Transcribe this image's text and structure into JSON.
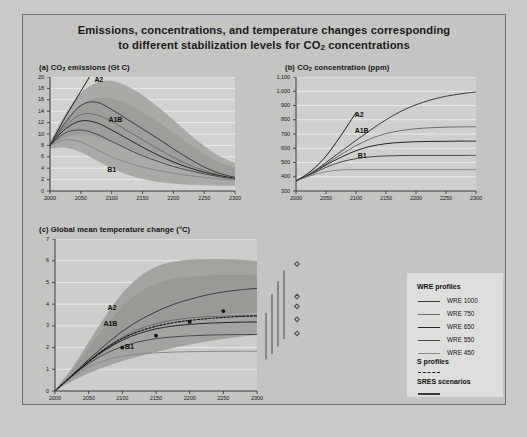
{
  "figure": {
    "title_line1": "Emissions, concentrations, and temperature changes corresponding",
    "title_line2_pre": "to different stabilization levels for CO",
    "title_line2_sub": "2",
    "title_line2_post": " concentrations",
    "caption": ""
  },
  "panels": {
    "a": {
      "label": "(a) CO",
      "label_sub": "2",
      "label_post": " emissions (Gt C)"
    },
    "b": {
      "label": "(b) CO",
      "label_sub": "2",
      "label_post": " concentration (ppm)"
    },
    "c": {
      "label": "(c) Global mean temperature change (°C)"
    }
  },
  "legend": {
    "heading_wre": "WRE profiles",
    "heading_s": "S profiles",
    "heading_sres": "SRES scenarios",
    "wre_items": [
      {
        "label": "WRE 1000",
        "color": "#3b3b3b"
      },
      {
        "label": "WRE 750",
        "color": "#6e6e6e"
      },
      {
        "label": "WRE 650",
        "color": "#262626"
      },
      {
        "label": "WRE 550",
        "color": "#4a4a4a"
      },
      {
        "label": "WRE 450",
        "color": "#8a8a8a"
      }
    ]
  },
  "annotations": {
    "a2": "A2",
    "a1b": "A1B",
    "b1": "B1"
  },
  "chart_data": [
    {
      "id": "panel-a",
      "type": "line",
      "title": "(a) CO2 emissions (Gt C)",
      "xlabel": "",
      "ylabel": "Gt C",
      "xlim": [
        2000,
        2300
      ],
      "ylim": [
        0,
        20
      ],
      "xticks": [
        2000,
        2050,
        2100,
        2150,
        2200,
        2250,
        2300
      ],
      "yticks": [
        0,
        2,
        4,
        6,
        8,
        10,
        12,
        14,
        16,
        18,
        20
      ],
      "grid": true,
      "x": [
        2000,
        2025,
        2050,
        2075,
        2100,
        2125,
        2150,
        2175,
        2200,
        2225,
        2250,
        2275,
        2300
      ],
      "series": [
        {
          "name": "WRE 1000",
          "color": "#3b3b3b",
          "values": [
            8.0,
            12.0,
            15.0,
            15.6,
            14.3,
            12.6,
            10.9,
            9.2,
            7.4,
            5.7,
            4.2,
            3.1,
            2.4
          ]
        },
        {
          "name": "WRE 750",
          "color": "#6e6e6e",
          "values": [
            8.0,
            11.4,
            13.4,
            13.4,
            12.2,
            10.6,
            9.0,
            7.4,
            5.9,
            4.6,
            3.6,
            2.8,
            2.2
          ]
        },
        {
          "name": "WRE 650",
          "color": "#262626",
          "values": [
            8.0,
            10.9,
            12.3,
            12.0,
            10.7,
            9.2,
            7.7,
            6.3,
            5.1,
            4.1,
            3.3,
            2.7,
            2.2
          ]
        },
        {
          "name": "WRE 550",
          "color": "#4a4a4a",
          "values": [
            8.0,
            10.2,
            10.7,
            10.0,
            8.7,
            7.4,
            6.2,
            5.2,
            4.3,
            3.6,
            3.0,
            2.5,
            2.1
          ]
        },
        {
          "name": "WRE 450",
          "color": "#8a8a8a",
          "values": [
            8.0,
            9.0,
            8.6,
            7.3,
            6.0,
            5.0,
            4.2,
            3.6,
            3.1,
            2.7,
            2.4,
            2.1,
            1.9
          ]
        },
        {
          "name": "A2 (SRES)",
          "color": "#1c1c1c",
          "values": [
            8.0,
            13.0,
            17.5,
            22.0,
            26.5,
            null,
            null,
            null,
            null,
            null,
            null,
            null,
            null
          ]
        }
      ],
      "envelope": {
        "name": "SRES range",
        "upper": [
          8.6,
          13.5,
          17.2,
          19.0,
          19.3,
          18.4,
          16.8,
          14.8,
          12.5,
          10.1,
          7.9,
          6.1,
          4.9
        ],
        "lower": [
          7.4,
          7.6,
          6.8,
          5.4,
          4.0,
          2.9,
          2.1,
          1.6,
          1.3,
          1.1,
          1.0,
          0.9,
          0.9
        ]
      },
      "annotations": [
        {
          "text": "A2",
          "x": 2072,
          "y": 19.4
        },
        {
          "text": "A1B",
          "x": 2095,
          "y": 12.4
        },
        {
          "text": "B1",
          "x": 2093,
          "y": 3.6
        }
      ]
    },
    {
      "id": "panel-b",
      "type": "line",
      "title": "(b) CO2 concentration (ppm)",
      "xlabel": "",
      "ylabel": "ppm",
      "xlim": [
        2000,
        2300
      ],
      "ylim": [
        300,
        1100
      ],
      "xticks": [
        2000,
        2050,
        2100,
        2150,
        2200,
        2250,
        2300
      ],
      "yticks": [
        300,
        400,
        500,
        600,
        700,
        800,
        900,
        1000,
        1100
      ],
      "ytick_labels": [
        "300",
        "400",
        "500",
        "600",
        "700",
        "800",
        "900",
        "1,000",
        "1,100"
      ],
      "grid": true,
      "x": [
        2000,
        2025,
        2050,
        2075,
        2100,
        2125,
        2150,
        2175,
        2200,
        2225,
        2250,
        2275,
        2300
      ],
      "series": [
        {
          "name": "WRE 1000",
          "color": "#3b3b3b",
          "values": [
            370,
            425,
            500,
            578,
            655,
            730,
            800,
            860,
            905,
            940,
            965,
            982,
            995
          ]
        },
        {
          "name": "WRE 750",
          "color": "#6e6e6e",
          "values": [
            370,
            422,
            490,
            556,
            618,
            668,
            703,
            724,
            737,
            744,
            748,
            750,
            751
          ]
        },
        {
          "name": "WRE 650",
          "color": "#262626",
          "values": [
            370,
            420,
            482,
            537,
            583,
            614,
            632,
            641,
            646,
            648,
            649,
            650,
            650
          ]
        },
        {
          "name": "WRE 550",
          "color": "#4a4a4a",
          "values": [
            370,
            416,
            466,
            504,
            527,
            540,
            546,
            549,
            550,
            550,
            550,
            550,
            550
          ]
        },
        {
          "name": "WRE 450",
          "color": "#8a8a8a",
          "values": [
            370,
            408,
            435,
            448,
            450,
            450,
            450,
            450,
            450,
            450,
            450,
            450,
            450
          ]
        },
        {
          "name": "A2 (SRES)",
          "color": "#1c1c1c",
          "values": [
            370,
            440,
            545,
            690,
            850,
            null,
            null,
            null,
            null,
            null,
            null,
            null,
            null
          ]
        }
      ],
      "annotations": [
        {
          "text": "A2",
          "x": 2098,
          "y": 836
        },
        {
          "text": "A1B",
          "x": 2098,
          "y": 718
        },
        {
          "text": "B1",
          "x": 2103,
          "y": 545
        }
      ]
    },
    {
      "id": "panel-c",
      "type": "line",
      "title": "(c) Global mean temperature change (°C)",
      "xlabel": "",
      "ylabel": "°C",
      "xlim": [
        2000,
        2300
      ],
      "ylim": [
        0,
        7
      ],
      "xticks": [
        2000,
        2050,
        2100,
        2150,
        2200,
        2250,
        2300
      ],
      "yticks": [
        0,
        1,
        2,
        3,
        4,
        5,
        6,
        7
      ],
      "grid": true,
      "x": [
        2000,
        2025,
        2050,
        2075,
        2100,
        2125,
        2150,
        2175,
        2200,
        2225,
        2250,
        2275,
        2300
      ],
      "series": [
        {
          "name": "WRE 1000",
          "color": "#3b3b3b",
          "values": [
            0.0,
            0.72,
            1.45,
            2.13,
            2.75,
            3.25,
            3.65,
            3.98,
            4.22,
            4.42,
            4.56,
            4.66,
            4.73
          ]
        },
        {
          "name": "WRE 750",
          "color": "#6e6e6e",
          "values": [
            0.0,
            0.7,
            1.38,
            1.98,
            2.48,
            2.85,
            3.1,
            3.26,
            3.36,
            3.42,
            3.45,
            3.47,
            3.48
          ]
        },
        {
          "name": "WRE 650",
          "color": "#262626",
          "values": [
            0.0,
            0.69,
            1.34,
            1.9,
            2.34,
            2.65,
            2.86,
            2.99,
            3.07,
            3.12,
            3.15,
            3.17,
            3.18
          ]
        },
        {
          "name": "WRE 550",
          "color": "#4a4a4a",
          "values": [
            0.0,
            0.67,
            1.26,
            1.72,
            2.05,
            2.27,
            2.41,
            2.49,
            2.54,
            2.57,
            2.59,
            2.6,
            2.6
          ]
        },
        {
          "name": "WRE 450",
          "color": "#8a8a8a",
          "values": [
            0.0,
            0.62,
            1.1,
            1.42,
            1.6,
            1.7,
            1.76,
            1.79,
            1.81,
            1.82,
            1.83,
            1.83,
            1.83
          ]
        },
        {
          "name": "S profiles (dashed)",
          "color": "#141414",
          "style": "dashed",
          "values": [
            0.0,
            0.7,
            1.36,
            1.95,
            2.42,
            2.75,
            2.98,
            3.14,
            3.25,
            3.33,
            3.39,
            3.43,
            3.46
          ]
        }
      ],
      "envelope": {
        "name": "SRES range",
        "upper": [
          0.05,
          1.05,
          2.25,
          3.45,
          4.5,
          5.25,
          5.72,
          5.95,
          6.05,
          6.08,
          6.08,
          6.05,
          6.0
        ],
        "lower": [
          0.0,
          0.45,
          0.82,
          1.12,
          1.38,
          1.6,
          1.8,
          1.98,
          2.14,
          2.28,
          2.4,
          2.5,
          2.58
        ]
      },
      "markers": [
        {
          "x": 2100,
          "y": 2.0
        },
        {
          "x": 2150,
          "y": 2.55
        },
        {
          "x": 2200,
          "y": 3.18
        },
        {
          "x": 2250,
          "y": 3.68
        }
      ],
      "annotations": [
        {
          "text": "A2",
          "x": 2078,
          "y": 3.82
        },
        {
          "text": "A1B",
          "x": 2072,
          "y": 3.08
        },
        {
          "text": "B1",
          "x": 2104,
          "y": 2.02
        }
      ],
      "error_bars": [
        {
          "x_px": 7,
          "low": 1.45,
          "high": 3.6
        },
        {
          "x_px": 13,
          "low": 1.7,
          "high": 4.45
        },
        {
          "x_px": 19,
          "low": 2.05,
          "high": 5.05
        },
        {
          "x_px": 25,
          "low": 2.4,
          "high": 5.55
        }
      ],
      "diamonds": [
        {
          "x_px": 38,
          "y": 5.85
        },
        {
          "x_px": 38,
          "y": 4.35
        },
        {
          "x_px": 38,
          "y": 3.9
        },
        {
          "x_px": 38,
          "y": 3.3
        },
        {
          "x_px": 38,
          "y": 2.65
        }
      ]
    }
  ]
}
